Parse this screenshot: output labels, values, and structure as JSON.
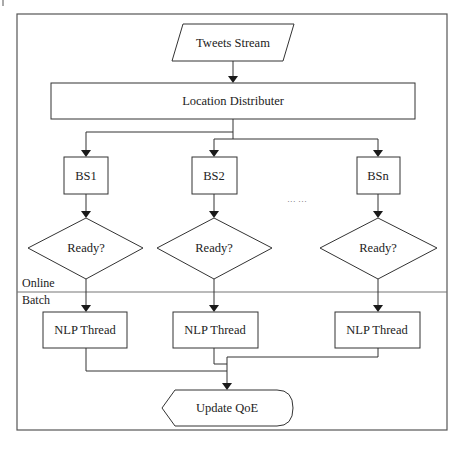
{
  "diagram": {
    "type": "flowchart",
    "zones": {
      "online": "Online",
      "batch": "Batch"
    },
    "nodes": {
      "input": {
        "label": "Tweets Stream",
        "shape": "parallelogram"
      },
      "distributor": {
        "label": "Location Distributer",
        "shape": "rectangle"
      },
      "base_stations": [
        {
          "label": "BS1",
          "shape": "rectangle"
        },
        {
          "label": "BS2",
          "shape": "rectangle"
        },
        {
          "label": "BSn",
          "shape": "rectangle"
        }
      ],
      "decisions": [
        {
          "label": "Ready?",
          "shape": "diamond"
        },
        {
          "label": "Ready?",
          "shape": "diamond"
        },
        {
          "label": "Ready?",
          "shape": "diamond"
        }
      ],
      "threads": [
        {
          "label": "NLP Thread",
          "shape": "rectangle"
        },
        {
          "label": "NLP Thread",
          "shape": "rectangle"
        },
        {
          "label": "NLP Thread",
          "shape": "rectangle"
        }
      ],
      "output": {
        "label": "Update QoE",
        "shape": "display"
      }
    },
    "ellipsis": "··· ···",
    "edges": [
      [
        "Tweets Stream",
        "Location Distributer"
      ],
      [
        "Location Distributer",
        "BS1"
      ],
      [
        "Location Distributer",
        "BS2"
      ],
      [
        "Location Distributer",
        "BSn"
      ],
      [
        "BS1",
        "Ready? (1)"
      ],
      [
        "BS2",
        "Ready? (2)"
      ],
      [
        "BSn",
        "Ready? (n)"
      ],
      [
        "Ready? (1)",
        "NLP Thread (1)"
      ],
      [
        "Ready? (2)",
        "NLP Thread (2)"
      ],
      [
        "Ready? (n)",
        "NLP Thread (n)"
      ],
      [
        "NLP Thread (1)",
        "Update QoE"
      ],
      [
        "NLP Thread (2)",
        "Update QoE"
      ],
      [
        "NLP Thread (n)",
        "Update QoE"
      ]
    ]
  }
}
